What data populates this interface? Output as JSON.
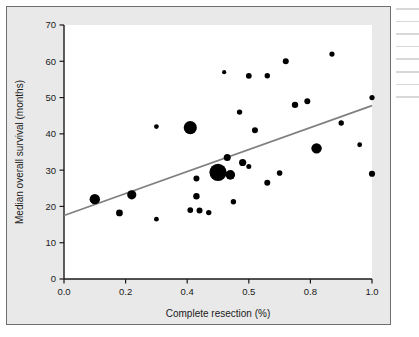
{
  "figure": {
    "background_color": "#e9e9e9",
    "plot_background_color": "#ffffff",
    "border_color": "#6f6f6f"
  },
  "chart_data": {
    "type": "scatter",
    "title": "",
    "subtitle": "",
    "xlabel": "Complete resection (%)",
    "ylabel": "Median overall survival (months)",
    "xlim": [
      0.0,
      1.0
    ],
    "ylim": [
      0,
      70
    ],
    "xticks": [
      0.0,
      0.2,
      0.4,
      0.6,
      0.8,
      1.0
    ],
    "xtick_labels": [
      "0.0",
      "0.2",
      "0.4",
      "0.5",
      "0.8",
      "1.0"
    ],
    "yticks": [
      0,
      10,
      20,
      30,
      40,
      50,
      60,
      70
    ],
    "ytick_labels": [
      "0",
      "10",
      "20",
      "30",
      "40",
      "50",
      "60",
      "70"
    ],
    "grid": false,
    "legend": false,
    "marker_color": "#000000",
    "marker_shape": "circle",
    "marker_size_meaning": "study weight",
    "points": [
      {
        "x": 0.1,
        "y": 22.0,
        "size": 5.2
      },
      {
        "x": 0.18,
        "y": 18.2,
        "size": 3.4
      },
      {
        "x": 0.22,
        "y": 23.2,
        "size": 4.6
      },
      {
        "x": 0.3,
        "y": 16.5,
        "size": 2.4
      },
      {
        "x": 0.3,
        "y": 42.0,
        "size": 2.4
      },
      {
        "x": 0.41,
        "y": 41.7,
        "size": 6.6
      },
      {
        "x": 0.41,
        "y": 19.0,
        "size": 2.9
      },
      {
        "x": 0.43,
        "y": 27.7,
        "size": 3.0
      },
      {
        "x": 0.43,
        "y": 22.8,
        "size": 3.2
      },
      {
        "x": 0.44,
        "y": 18.9,
        "size": 3.0
      },
      {
        "x": 0.47,
        "y": 18.3,
        "size": 2.7
      },
      {
        "x": 0.5,
        "y": 29.4,
        "size": 8.6
      },
      {
        "x": 0.52,
        "y": 57.0,
        "size": 2.1
      },
      {
        "x": 0.53,
        "y": 33.5,
        "size": 3.5
      },
      {
        "x": 0.54,
        "y": 28.7,
        "size": 4.8
      },
      {
        "x": 0.55,
        "y": 21.3,
        "size": 2.7
      },
      {
        "x": 0.57,
        "y": 46.0,
        "size": 2.7
      },
      {
        "x": 0.58,
        "y": 32.1,
        "size": 3.6
      },
      {
        "x": 0.6,
        "y": 31.0,
        "size": 2.5
      },
      {
        "x": 0.6,
        "y": 56.0,
        "size": 2.9
      },
      {
        "x": 0.62,
        "y": 41.0,
        "size": 3.0
      },
      {
        "x": 0.66,
        "y": 56.0,
        "size": 2.7
      },
      {
        "x": 0.66,
        "y": 26.5,
        "size": 3.0
      },
      {
        "x": 0.7,
        "y": 29.2,
        "size": 2.8
      },
      {
        "x": 0.72,
        "y": 60.0,
        "size": 3.0
      },
      {
        "x": 0.75,
        "y": 48.0,
        "size": 3.2
      },
      {
        "x": 0.79,
        "y": 49.0,
        "size": 3.0
      },
      {
        "x": 0.82,
        "y": 36.0,
        "size": 5.2
      },
      {
        "x": 0.87,
        "y": 62.0,
        "size": 2.6
      },
      {
        "x": 0.9,
        "y": 43.0,
        "size": 2.7
      },
      {
        "x": 0.96,
        "y": 37.0,
        "size": 2.4
      },
      {
        "x": 1.0,
        "y": 50.0,
        "size": 2.6
      },
      {
        "x": 1.0,
        "y": 29.0,
        "size": 3.1
      }
    ],
    "trendline": {
      "name": "regression line",
      "color": "#808080",
      "x_start": 0.0,
      "y_start": 17.5,
      "x_end": 1.0,
      "y_end": 47.8
    }
  }
}
